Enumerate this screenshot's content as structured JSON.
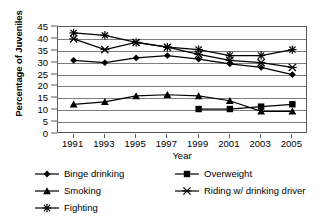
{
  "chart_data": {
    "type": "line",
    "title": "",
    "xlabel": "Year",
    "ylabel": "Percentage of Juveniles",
    "categories": [
      "1991",
      "1993",
      "1995",
      "1997",
      "1999",
      "2001",
      "2003",
      "2005"
    ],
    "x": [
      1991,
      1993,
      1995,
      1997,
      1999,
      2001,
      2003,
      2005
    ],
    "xlim": [
      1990,
      2006
    ],
    "ylim": [
      0,
      45
    ],
    "ytick_labels": [
      "0",
      "5",
      "10",
      "15",
      "20",
      "25",
      "30",
      "35",
      "40",
      "45"
    ],
    "yticks": [
      0,
      5,
      10,
      15,
      20,
      25,
      30,
      35,
      40,
      45
    ],
    "grid": "horizontal",
    "legend_position": "below",
    "series": [
      {
        "name": "Binge drinking",
        "marker": "diamond",
        "color": "#000000",
        "values": [
          31,
          30,
          32,
          33,
          31.5,
          29.5,
          28,
          25
        ]
      },
      {
        "name": "Overweight",
        "marker": "square",
        "color": "#000000",
        "values": [
          null,
          null,
          null,
          null,
          10.5,
          10.5,
          11.5,
          12.5
        ]
      },
      {
        "name": "Smoking",
        "marker": "triangle",
        "color": "#000000",
        "values": [
          12.5,
          13.5,
          16,
          16.5,
          16,
          14,
          9.5,
          9.5
        ]
      },
      {
        "name": "Riding w/ drinking driver",
        "marker": "x",
        "color": "#000000",
        "values": [
          40,
          35.5,
          38.5,
          36.5,
          33.5,
          31,
          30,
          28
        ]
      },
      {
        "name": "Fighting",
        "marker": "asterisk",
        "color": "#000000",
        "values": [
          42.5,
          41.5,
          38.5,
          36.5,
          35.5,
          33,
          33,
          35.5
        ]
      }
    ]
  },
  "axis": {
    "y_title": "Percentage of Juveniles",
    "x_title": "Year"
  },
  "legend": {
    "items": [
      {
        "label": "Binge drinking",
        "marker": "diamond"
      },
      {
        "label": "Overweight",
        "marker": "square"
      },
      {
        "label": "Smoking",
        "marker": "triangle"
      },
      {
        "label": "Riding w/ drinking driver",
        "marker": "x"
      },
      {
        "label": "Fighting",
        "marker": "asterisk"
      }
    ]
  }
}
